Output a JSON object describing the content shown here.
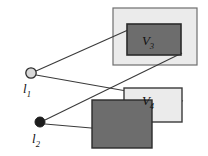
{
  "figure": {
    "type": "diagram",
    "background": "#ffffff",
    "width": 208,
    "height": 156
  },
  "colors": {
    "light_region_fill": "#ebebeb",
    "light_region_stroke": "#6e6e6e",
    "dark_region_fill": "#6d6d6d",
    "dark_region_stroke": "#2b2b2b",
    "ray_stroke": "#3a3a3a",
    "light_open_fill": "#d9d9d9",
    "light_filled_fill": "#1d1d1d",
    "label_color": "#111111"
  },
  "light_sources": [
    {
      "id": "l1",
      "label": "l",
      "subscript": "1",
      "style": "open-circle",
      "cx": 31,
      "cy": 73,
      "r": 5.2,
      "label_x": 25,
      "label_y": 92
    },
    {
      "id": "l2",
      "label": "l",
      "subscript": "2",
      "style": "filled-circle",
      "cx": 40,
      "cy": 122,
      "r": 5.0,
      "label_x": 33,
      "label_y": 142
    }
  ],
  "regions": [
    {
      "id": "upper-light-region",
      "kind": "light",
      "x": 113,
      "y": 8,
      "w": 84,
      "h": 57
    },
    {
      "id": "upper-dark-region",
      "kind": "dark",
      "x": 127,
      "y": 24,
      "w": 54,
      "h": 31,
      "label": "V",
      "subscript": "3",
      "label_x": 148,
      "label_y": 44
    },
    {
      "id": "lower-light-region",
      "kind": "light",
      "x": 124,
      "y": 88,
      "w": 58,
      "h": 34,
      "label": "V",
      "subscript": "4",
      "label_x": 146,
      "label_y": 104
    },
    {
      "id": "lower-dark-region",
      "kind": "dark",
      "x": 92,
      "y": 100,
      "w": 60,
      "h": 48
    }
  ],
  "rays": [
    {
      "id": "ray-l1-to-upper-dark-left",
      "from": "l1",
      "x1": 36,
      "y1": 71,
      "x2": 128,
      "y2": 30
    },
    {
      "id": "ray-l1-to-lower-light-left",
      "from": "l1",
      "x1": 36,
      "y1": 75,
      "x2": 183,
      "y2": 101
    },
    {
      "id": "ray-l2-to-upper-dark-right",
      "from": "l2",
      "x1": 45,
      "y1": 120,
      "x2": 182,
      "y2": 53
    },
    {
      "id": "ray-l2-to-lower-dark-left",
      "from": "l2",
      "x1": 45,
      "y1": 124,
      "x2": 126,
      "y2": 131
    }
  ],
  "labels": {
    "v3": "V",
    "v3_sub": "3",
    "v4": "V",
    "v4_sub": "4",
    "l1": "l",
    "l1_sub": "1",
    "l2": "l",
    "l2_sub": "2"
  }
}
